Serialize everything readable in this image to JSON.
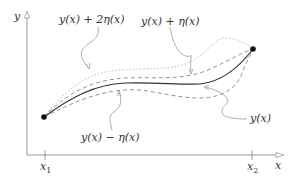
{
  "diagram": {
    "axes": {
      "x_label": "x",
      "y_label": "y",
      "x_ticks": [
        {
          "name": "x",
          "sub": "1"
        },
        {
          "name": "x",
          "sub": "2"
        }
      ]
    },
    "curves": [
      {
        "id": "y",
        "label": "y(x)",
        "style": "solid",
        "color": "#222222"
      },
      {
        "id": "y_plus_eta",
        "label": "y(x) + η(x)",
        "style": "dashed",
        "color": "#888888"
      },
      {
        "id": "y_plus_2eta",
        "label": "y(x) + 2η(x)",
        "style": "dotted",
        "color": "#aaaaaa"
      },
      {
        "id": "y_minus_eta",
        "label": "y(x) − η(x)",
        "style": "dashed",
        "color": "#888888"
      }
    ],
    "endpoints": [
      {
        "label": "start",
        "x": 44,
        "y": 117
      },
      {
        "label": "end",
        "x": 253,
        "y": 49
      }
    ],
    "labels": {
      "y_plus_2eta": "y(x) + 2η(x)",
      "y_plus_eta": "y(x) + η(x)",
      "y_minus_eta": "y(x) − η(x)",
      "y": "y(x)"
    }
  }
}
